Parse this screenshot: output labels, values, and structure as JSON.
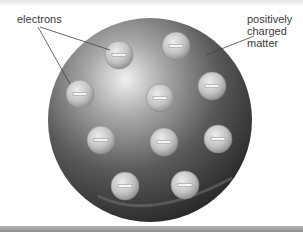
{
  "diagram": {
    "labels": {
      "electrons": "electrons",
      "matter_line1": "positively",
      "matter_line2": "charged",
      "matter_line3": "matter"
    },
    "sphere": {
      "cx": 150,
      "cy": 120,
      "r": 102,
      "color_dark": "#2a2a2a",
      "color_light": "#d8d8d8"
    },
    "electrons": [
      {
        "cx": 119,
        "cy": 55,
        "symbol": "−"
      },
      {
        "cx": 176,
        "cy": 46,
        "symbol": "−"
      },
      {
        "cx": 80,
        "cy": 94,
        "symbol": "−"
      },
      {
        "cx": 160,
        "cy": 98,
        "symbol": "−"
      },
      {
        "cx": 212,
        "cy": 86,
        "symbol": "−"
      },
      {
        "cx": 101,
        "cy": 140,
        "symbol": "−"
      },
      {
        "cx": 164,
        "cy": 142,
        "symbol": "−"
      },
      {
        "cx": 218,
        "cy": 139,
        "symbol": "−"
      },
      {
        "cx": 125,
        "cy": 186,
        "symbol": "−"
      },
      {
        "cx": 185,
        "cy": 185,
        "symbol": "−"
      }
    ]
  }
}
